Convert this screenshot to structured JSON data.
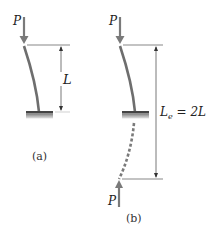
{
  "figure": {
    "panel_a": {
      "caption": "(a)",
      "load_label": "P",
      "length_label": "L"
    },
    "panel_b": {
      "caption": "(b)",
      "top_load_label": "P",
      "bottom_load_label": "P",
      "effective_length_label": "L",
      "effective_length_subscript": "e",
      "effective_length_expr": " = 2L"
    },
    "colors": {
      "column": "#6e6e6e",
      "arrow": "#7a7a7a",
      "dimension": "#555555",
      "ground": "#8a8a8a",
      "text": "#222222"
    }
  }
}
